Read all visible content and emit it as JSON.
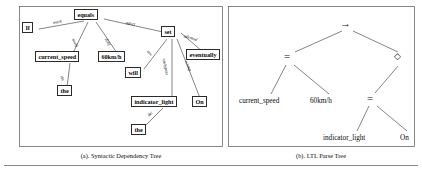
{
  "figure": {
    "captions": {
      "left": "(a). Syntactic Dependency Tree",
      "right": "(b). LTL Parse Tree"
    }
  },
  "dependency_tree": {
    "title": "Syntactic Dependency Tree",
    "nodes": [
      {
        "id": "if",
        "label": "If",
        "x": 27,
        "y": 27
      },
      {
        "id": "equals",
        "label": "equals",
        "x": 86,
        "y": 13
      },
      {
        "id": "set",
        "label": "set",
        "x": 166,
        "y": 30
      },
      {
        "id": "current_speed",
        "label": "current_speed",
        "x": 57,
        "y": 55
      },
      {
        "id": "60kmh",
        "label": "60km/h",
        "x": 110,
        "y": 55
      },
      {
        "id": "the1",
        "label": "the",
        "x": 62,
        "y": 88
      },
      {
        "id": "will",
        "label": "will",
        "x": 133,
        "y": 71
      },
      {
        "id": "indicator_light",
        "label": "indicator_light",
        "x": 155,
        "y": 100
      },
      {
        "id": "on",
        "label": "On",
        "x": 198,
        "y": 100
      },
      {
        "id": "the2",
        "label": "the",
        "x": 136,
        "y": 128
      },
      {
        "id": "eventually",
        "label": "eventually",
        "x": 203,
        "y": 53
      }
    ],
    "edges": [
      {
        "from": "equals",
        "to": "if",
        "label": "mark"
      },
      {
        "from": "equals",
        "to": "current_speed",
        "label": "nsubj"
      },
      {
        "from": "equals",
        "to": "60kmh",
        "label": "dobj"
      },
      {
        "from": "equals",
        "to": "set",
        "label": "advcl"
      },
      {
        "from": "current_speed",
        "to": "the1",
        "label": "det"
      },
      {
        "from": "set",
        "to": "will",
        "label": "aux"
      },
      {
        "from": "set",
        "to": "indicator_light",
        "label": "nsubjpass"
      },
      {
        "from": "set",
        "to": "on",
        "label": "xcomp"
      },
      {
        "from": "set",
        "to": "eventually",
        "label": "advmod"
      },
      {
        "from": "indicator_light",
        "to": "the2",
        "label": "det"
      }
    ]
  },
  "ltl_parse_tree": {
    "title": "LTL Parse Tree",
    "nodes": [
      {
        "id": "implies",
        "symbol": "→",
        "kind": "operator",
        "x": 346,
        "y": 23
      },
      {
        "id": "eq1",
        "symbol": "=",
        "kind": "operator",
        "x": 289,
        "y": 57
      },
      {
        "id": "diamond",
        "symbol": "◇",
        "kind": "operator",
        "x": 399,
        "y": 58
      },
      {
        "id": "eq2",
        "symbol": "=",
        "kind": "operator",
        "x": 372,
        "y": 99
      },
      {
        "id": "cs",
        "symbol": "current_speed",
        "kind": "leaf",
        "x": 265,
        "y": 101
      },
      {
        "id": "spd",
        "symbol": "60km/h",
        "kind": "leaf",
        "x": 324,
        "y": 101
      },
      {
        "id": "il",
        "symbol": "indicator_light",
        "kind": "leaf",
        "x": 350,
        "y": 138
      },
      {
        "id": "onval",
        "symbol": "On",
        "kind": "leaf",
        "x": 407,
        "y": 138
      }
    ],
    "edges": [
      {
        "from": "implies",
        "to": "eq1"
      },
      {
        "from": "implies",
        "to": "diamond"
      },
      {
        "from": "eq1",
        "to": "cs"
      },
      {
        "from": "eq1",
        "to": "spd"
      },
      {
        "from": "diamond",
        "to": "eq2"
      },
      {
        "from": "eq2",
        "to": "il"
      },
      {
        "from": "eq2",
        "to": "onval"
      }
    ]
  },
  "colors": {
    "stroke": "#333333",
    "box_border": "#2a2a2a",
    "text": "#0b0b0b",
    "panel": "#555555",
    "background": "#ffffff"
  }
}
